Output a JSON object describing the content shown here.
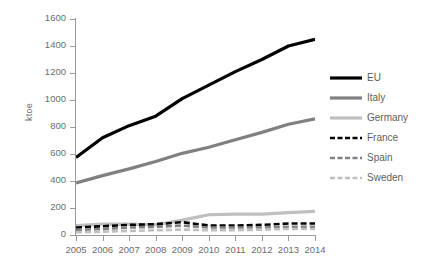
{
  "chart": {
    "ylabel": "ktoe",
    "title": "",
    "xlabel": ""
  },
  "chart_data": {
    "type": "line",
    "title": "",
    "xlabel": "",
    "ylabel": "ktoe",
    "x": [
      2005,
      2006,
      2007,
      2008,
      2009,
      2010,
      2011,
      2012,
      2013,
      2014
    ],
    "categories": [
      "2005",
      "2006",
      "2007",
      "2008",
      "2009",
      "2010",
      "2011",
      "2012",
      "2013",
      "2014"
    ],
    "ylim": [
      0,
      1600
    ],
    "yticks": [
      0,
      200,
      400,
      600,
      800,
      1000,
      1200,
      1400,
      1600
    ],
    "ytick_labels": [
      "0",
      "200",
      "400",
      "600",
      "800",
      "1000",
      "1200",
      "1400",
      "1600"
    ],
    "grid": false,
    "legend_position": "right",
    "series": [
      {
        "name": "EU",
        "color": "#000000",
        "style": "solid",
        "width": 3.2,
        "values": [
          575,
          720,
          810,
          880,
          1010,
          1110,
          1210,
          1300,
          1400,
          1450
        ]
      },
      {
        "name": "Italy",
        "color": "#808080",
        "style": "solid",
        "width": 3.2,
        "values": [
          385,
          440,
          490,
          545,
          605,
          650,
          705,
          760,
          820,
          860
        ]
      },
      {
        "name": "Germany",
        "color": "#bfbfbf",
        "style": "solid",
        "width": 3.2,
        "values": [
          70,
          80,
          80,
          75,
          110,
          150,
          155,
          155,
          165,
          175
        ]
      },
      {
        "name": "France",
        "color": "#000000",
        "style": "dashed",
        "width": 2.6,
        "values": [
          55,
          65,
          75,
          80,
          95,
          70,
          70,
          75,
          85,
          85
        ]
      },
      {
        "name": "Spain",
        "color": "#808080",
        "style": "dashed",
        "width": 2.6,
        "values": [
          35,
          45,
          55,
          60,
          70,
          55,
          55,
          55,
          60,
          60
        ]
      },
      {
        "name": "Sweden",
        "color": "#bfbfbf",
        "style": "dashed",
        "width": 2.6,
        "values": [
          20,
          25,
          30,
          35,
          40,
          35,
          35,
          40,
          45,
          45
        ]
      }
    ]
  }
}
